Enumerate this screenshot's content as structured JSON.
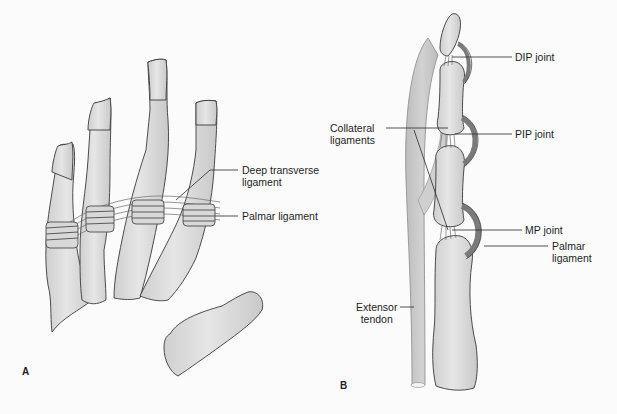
{
  "figure": {
    "panels": [
      {
        "id": "A",
        "letter": "A",
        "subject": "Hand bones (metacarpals / proximal phalanges) with ligaments",
        "labels": {
          "deep_transverse_ligament_line1": "Deep transverse",
          "deep_transverse_ligament_line2": "ligament",
          "palmar_ligament": "Palmar ligament"
        }
      },
      {
        "id": "B",
        "letter": "B",
        "subject": "Lateral view of finger joints",
        "labels": {
          "dip_joint": "DIP joint",
          "pip_joint": "PIP joint",
          "collateral_ligaments_line1": "Collateral",
          "collateral_ligaments_line2": "ligaments",
          "mp_joint": "MP joint",
          "palmar_ligament_line1": "Palmar",
          "palmar_ligament_line2": "ligament",
          "extensor_tendon_line1": "Extensor",
          "extensor_tendon_line2": "tendon"
        }
      }
    ],
    "colors": {
      "background": "#fbfbfb",
      "bone_fill": "#dcdcdc",
      "bone_stroke": "#3a3a3a",
      "ligament_dark": "#8a8a8a",
      "tendon_fill": "#c8c8c8",
      "leader_line": "#2a2a2a"
    }
  }
}
